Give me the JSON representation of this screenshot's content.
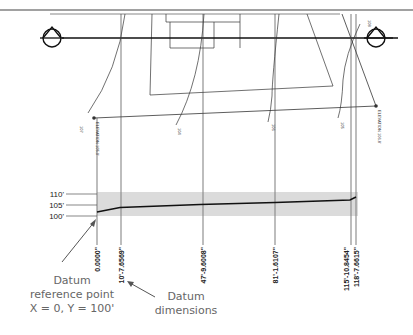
{
  "diagram": {
    "elevation_labels": [
      "110'",
      "105'",
      "100'"
    ],
    "station_labels": [
      "0.0000\"",
      "10'-7.6569\"",
      "47'-9.6008\"",
      "81'-1.6107\"",
      "115'-10.8454\"",
      "118'-7.6615\""
    ],
    "benchmark_labels": [
      "ELEVATION 105.0'",
      "ELEVATION 106.8'"
    ],
    "contour_labels": [
      "107",
      "104",
      "106",
      "105",
      "108"
    ],
    "callouts": {
      "datum_reference": {
        "line1": "Datum",
        "line2": "reference point",
        "line3": "X = 0, Y = 100'"
      },
      "datum_dimensions": {
        "line1": "Datum",
        "line2": "dimensions"
      }
    },
    "colors": {
      "ink": "#222222",
      "grid": "#888888",
      "callout_text": "#666666"
    }
  }
}
